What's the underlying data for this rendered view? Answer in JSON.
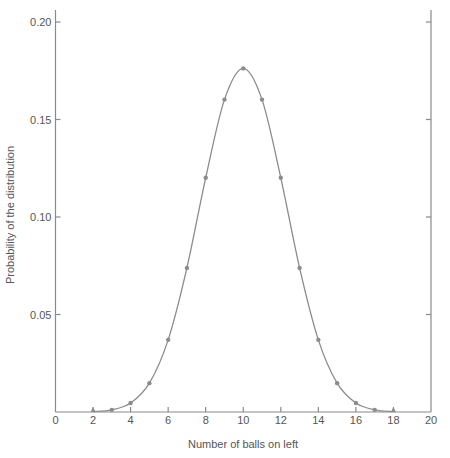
{
  "chart_data": {
    "type": "line",
    "title": "",
    "xlabel": "Number of balls on left",
    "ylabel": "Probability of the distribution",
    "xlim": [
      0,
      20
    ],
    "ylim": [
      0,
      0.2
    ],
    "grid": false,
    "legend": null,
    "x_ticks": [
      0,
      2,
      4,
      6,
      8,
      10,
      12,
      14,
      16,
      18,
      20
    ],
    "x_tick_labels": [
      "0",
      "2",
      "4",
      "6",
      "8",
      "10",
      "12",
      "14",
      "16",
      "18",
      "20"
    ],
    "y_ticks": [
      0.05,
      0.1,
      0.15,
      0.2
    ],
    "y_tick_labels": [
      "0.05",
      "0.10",
      "0.15",
      "0.20"
    ],
    "series": [
      {
        "name": "Binomial distribution (n=20, p=0.5)",
        "x": [
          2,
          3,
          4,
          5,
          6,
          7,
          8,
          9,
          10,
          11,
          12,
          13,
          14,
          15,
          16,
          17,
          18
        ],
        "values": [
          0.0002,
          0.0011,
          0.0046,
          0.0148,
          0.037,
          0.0739,
          0.1201,
          0.1602,
          0.1762,
          0.1602,
          0.1201,
          0.0739,
          0.037,
          0.0148,
          0.0046,
          0.0011,
          0.0002
        ],
        "color": "#8c8c8c",
        "style": "smooth line with dot markers"
      }
    ]
  }
}
